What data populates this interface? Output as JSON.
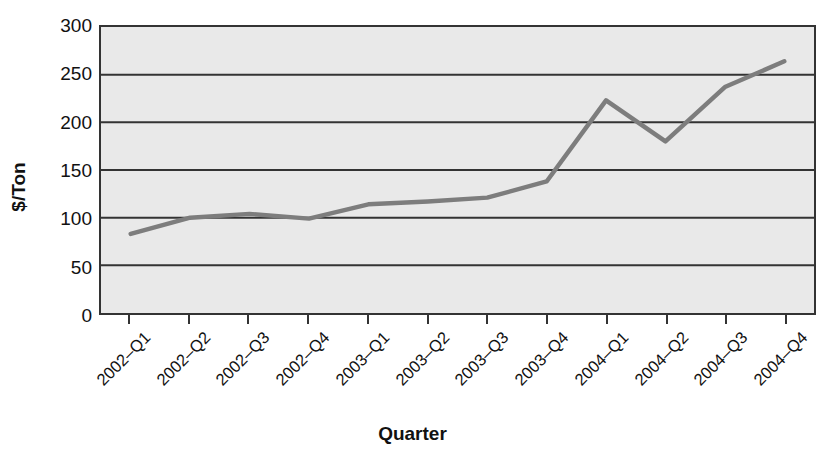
{
  "chart_data": {
    "type": "line",
    "title": "",
    "xlabel": "Quarter",
    "ylabel": "$/Ton",
    "categories": [
      "2002–Q1",
      "2002–Q2",
      "2002–Q3",
      "2002–Q4",
      "2003–Q1",
      "2003–Q2",
      "2003–Q3",
      "2003–Q4",
      "2004–Q1",
      "2004–Q2",
      "2004–Q3",
      "2004–Q4"
    ],
    "values": [
      83,
      100,
      104,
      99,
      114,
      117,
      121,
      138,
      223,
      180,
      237,
      264
    ],
    "ylim": [
      0,
      300
    ],
    "yticks": [
      0,
      50,
      100,
      150,
      200,
      250,
      300
    ],
    "ytick_labels": [
      "0",
      "50",
      "100",
      "150",
      "200",
      "250",
      "300"
    ],
    "grid": "horizontal",
    "legend": "none",
    "series_name": "Price",
    "line_color": "#7d7d7d",
    "plot_background": "#e9e9e9",
    "axis_color": "#333333",
    "grid_color": "#333333",
    "text_color": "#111111"
  }
}
